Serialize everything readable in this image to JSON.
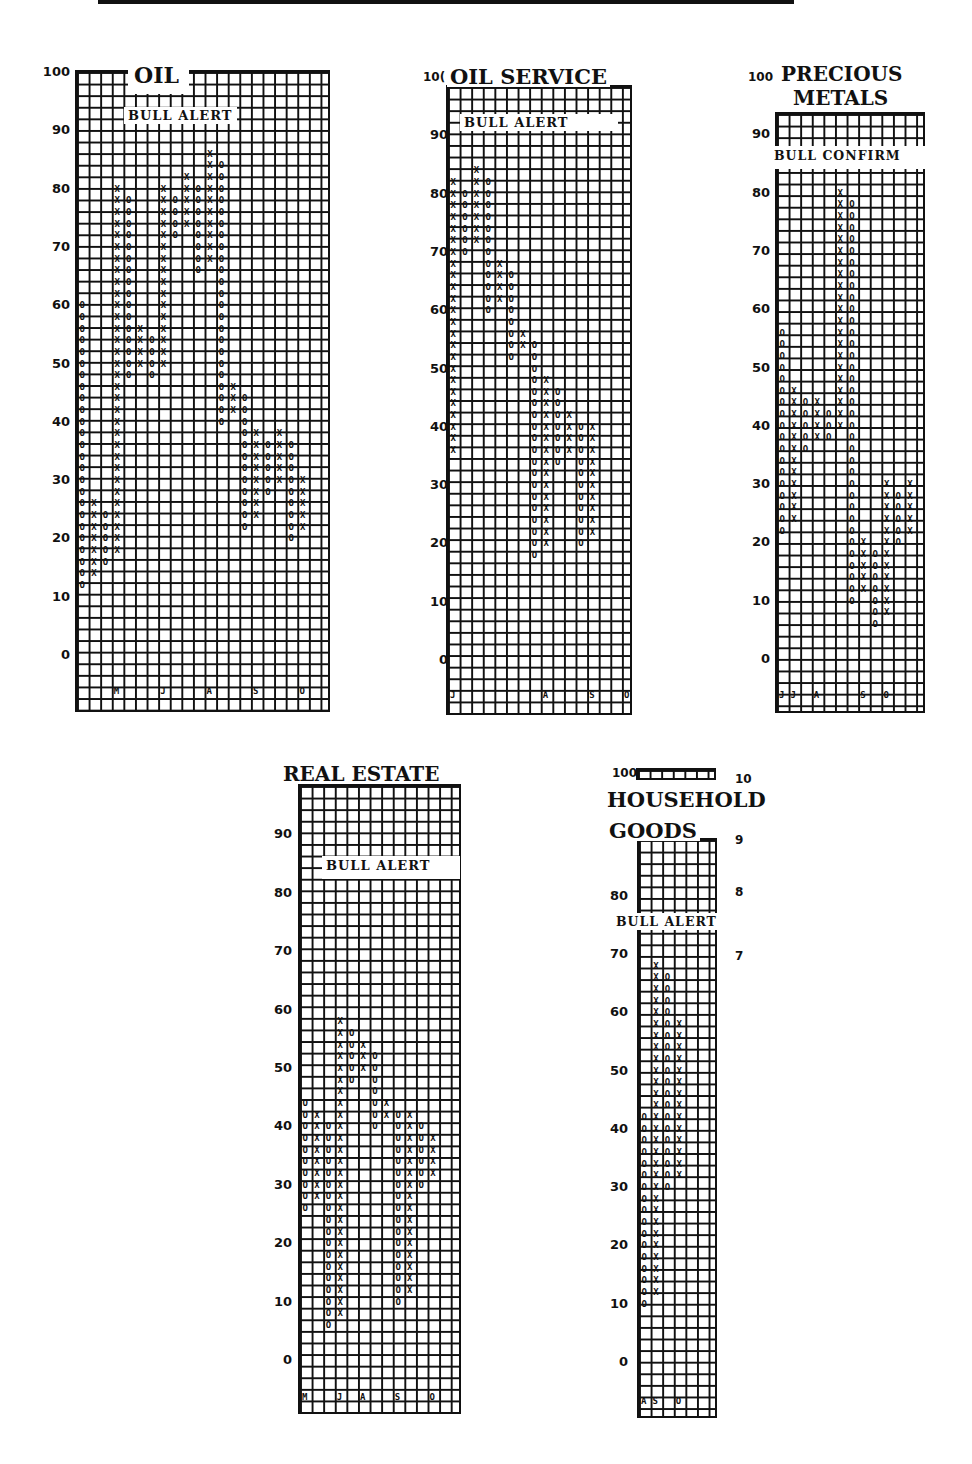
{
  "chart_data": [
    {
      "type": "point_and_figure",
      "title": "OIL",
      "status": "BULL ALERT",
      "ylabel": "Bullish Percent",
      "ylim": [
        0,
        100
      ],
      "y_ticks": [
        100,
        90,
        80,
        70,
        60,
        50,
        40,
        30,
        20,
        10,
        0
      ],
      "box_size": 2,
      "columns": [
        {
          "type": "O",
          "from": 60,
          "to": 12
        },
        {
          "type": "X",
          "from": 14,
          "to": 26
        },
        {
          "type": "O",
          "from": 24,
          "to": 16
        },
        {
          "type": "X",
          "from": 18,
          "to": 80
        },
        {
          "type": "O",
          "from": 78,
          "to": 48
        },
        {
          "type": "X",
          "from": 50,
          "to": 56
        },
        {
          "type": "O",
          "from": 54,
          "to": 48
        },
        {
          "type": "X",
          "from": 50,
          "to": 80
        },
        {
          "type": "O",
          "from": 78,
          "to": 72
        },
        {
          "type": "X",
          "from": 74,
          "to": 82
        },
        {
          "type": "O",
          "from": 80,
          "to": 66
        },
        {
          "type": "X",
          "from": 68,
          "to": 86
        },
        {
          "type": "O",
          "from": 84,
          "to": 40
        },
        {
          "type": "X",
          "from": 42,
          "to": 46
        },
        {
          "type": "O",
          "from": 44,
          "to": 22
        },
        {
          "type": "X",
          "from": 24,
          "to": 38
        },
        {
          "type": "O",
          "from": 36,
          "to": 28
        },
        {
          "type": "X",
          "from": 30,
          "to": 38
        },
        {
          "type": "O",
          "from": 36,
          "to": 20
        },
        {
          "type": "X",
          "from": 22,
          "to": 30
        }
      ],
      "month_markers": [
        "M",
        "J",
        "A",
        "S",
        "O"
      ]
    },
    {
      "type": "point_and_figure",
      "title": "OIL SERVICE",
      "status": "BULL ALERT",
      "ylim": [
        0,
        100
      ],
      "y_ticks": [
        100,
        90,
        80,
        70,
        60,
        50,
        40,
        30,
        20,
        10,
        0
      ],
      "box_size": 2,
      "columns": [
        {
          "type": "X",
          "from": 36,
          "to": 82
        },
        {
          "type": "O",
          "from": 80,
          "to": 70
        },
        {
          "type": "X",
          "from": 72,
          "to": 84
        },
        {
          "type": "O",
          "from": 82,
          "to": 60
        },
        {
          "type": "X",
          "from": 62,
          "to": 68
        },
        {
          "type": "O",
          "from": 66,
          "to": 52
        },
        {
          "type": "X",
          "from": 54,
          "to": 56
        },
        {
          "type": "O",
          "from": 54,
          "to": 18
        },
        {
          "type": "X",
          "from": 20,
          "to": 48
        },
        {
          "type": "O",
          "from": 46,
          "to": 34
        },
        {
          "type": "X",
          "from": 36,
          "to": 42
        },
        {
          "type": "O",
          "from": 40,
          "to": 20
        },
        {
          "type": "X",
          "from": 22,
          "to": 40
        }
      ],
      "month_markers": [
        "J",
        "A",
        "S",
        "O"
      ]
    },
    {
      "type": "point_and_figure",
      "title": "PRECIOUS METALS",
      "status": "BULL CONFIRM",
      "ylim": [
        0,
        100
      ],
      "y_ticks": [
        100,
        90,
        80,
        70,
        60,
        50,
        40,
        30,
        20,
        10,
        0
      ],
      "box_size": 2,
      "columns": [
        {
          "type": "O",
          "from": 56,
          "to": 22
        },
        {
          "type": "X",
          "from": 24,
          "to": 46
        },
        {
          "type": "O",
          "from": 44,
          "to": 36
        },
        {
          "type": "X",
          "from": 38,
          "to": 44
        },
        {
          "type": "O",
          "from": 42,
          "to": 38
        },
        {
          "type": "X",
          "from": 40,
          "to": 80
        },
        {
          "type": "O",
          "from": 78,
          "to": 10
        },
        {
          "type": "X",
          "from": 12,
          "to": 20
        },
        {
          "type": "O",
          "from": 18,
          "to": 6
        },
        {
          "type": "X",
          "from": 8,
          "to": 30
        },
        {
          "type": "O",
          "from": 28,
          "to": 20
        },
        {
          "type": "X",
          "from": 22,
          "to": 30
        }
      ],
      "month_markers": [
        "J",
        "J",
        "A",
        "S",
        "O"
      ]
    },
    {
      "type": "point_and_figure",
      "title": "REAL ESTATE",
      "status": "BULL ALERT",
      "ylim": [
        0,
        100
      ],
      "y_ticks": [
        90,
        80,
        70,
        60,
        50,
        40,
        30,
        20,
        10,
        0
      ],
      "box_size": 2,
      "columns": [
        {
          "type": "O",
          "from": 44,
          "to": 26
        },
        {
          "type": "X",
          "from": 28,
          "to": 42
        },
        {
          "type": "O",
          "from": 40,
          "to": 6
        },
        {
          "type": "X",
          "from": 8,
          "to": 58
        },
        {
          "type": "O",
          "from": 56,
          "to": 48
        },
        {
          "type": "X",
          "from": 50,
          "to": 54
        },
        {
          "type": "O",
          "from": 52,
          "to": 40
        },
        {
          "type": "X",
          "from": 42,
          "to": 44
        },
        {
          "type": "O",
          "from": 42,
          "to": 10
        },
        {
          "type": "X",
          "from": 12,
          "to": 42
        },
        {
          "type": "O",
          "from": 40,
          "to": 30
        },
        {
          "type": "X",
          "from": 32,
          "to": 38
        }
      ],
      "month_markers": [
        "M",
        "J",
        "A",
        "S",
        "O"
      ]
    },
    {
      "type": "point_and_figure",
      "title": "HOUSEHOLD GOODS",
      "status": "BULL ALERT",
      "ylim": [
        0,
        100
      ],
      "y_ticks": [
        100,
        80,
        70,
        60,
        50,
        40,
        30,
        20,
        10,
        0
      ],
      "right_ticks": [
        "10",
        "9",
        "8",
        "7"
      ],
      "box_size": 2,
      "columns": [
        {
          "type": "O",
          "from": 42,
          "to": 10
        },
        {
          "type": "X",
          "from": 12,
          "to": 68
        },
        {
          "type": "O",
          "from": 66,
          "to": 30
        },
        {
          "type": "X",
          "from": 32,
          "to": 58
        }
      ],
      "month_markers": [
        "A",
        "S",
        "O"
      ]
    }
  ],
  "charts": {
    "oil": {
      "title": "OIL",
      "status": "BULL ALERT",
      "ticks": [
        "100",
        "90",
        "80",
        "70",
        "60",
        "50",
        "40",
        "30",
        "20",
        "10",
        "0"
      ],
      "months": [
        "M",
        "J",
        "A",
        "S",
        "O"
      ]
    },
    "oilservice": {
      "title": "OIL SERVICE",
      "status": "BULL ALERT",
      "title_prefix": "10(",
      "ticks": [
        "90",
        "80",
        "70",
        "60",
        "50",
        "40",
        "30",
        "20",
        "10",
        "0"
      ],
      "months": [
        "J",
        "A",
        "S",
        "O"
      ]
    },
    "metals": {
      "title1": "PRECIOUS",
      "title2": "METALS",
      "status": "BULL CONFIRM",
      "top_tick": "100",
      "ticks": [
        "90",
        "80",
        "70",
        "60",
        "50",
        "40",
        "30",
        "20",
        "10",
        "0"
      ],
      "months": [
        "J",
        "J",
        "A",
        "S",
        "O"
      ]
    },
    "realestate": {
      "title": "REAL ESTATE",
      "status": "BULL ALERT",
      "ticks": [
        "90",
        "80",
        "70",
        "60",
        "50",
        "40",
        "30",
        "20",
        "10",
        "0"
      ],
      "months": [
        "M",
        "J",
        "A",
        "S",
        "O"
      ]
    },
    "household": {
      "title1": "HOUSEHOLD",
      "title2": "GOODS",
      "status": "BULL ALERT",
      "top_tick": "100",
      "ticks": [
        "80",
        "70",
        "60",
        "50",
        "40",
        "30",
        "20",
        "10",
        "0"
      ],
      "right_ticks": [
        "10",
        "9",
        "8",
        "7"
      ],
      "months": [
        "A",
        "S",
        "O"
      ]
    }
  }
}
